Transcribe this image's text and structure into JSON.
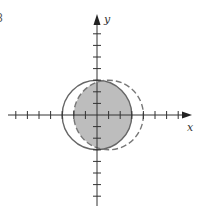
{
  "figure": {
    "number_label": "8",
    "x_axis_label": "x",
    "y_axis_label": "y"
  },
  "colors": {
    "axis": "#333333",
    "circle_stroke": "#666666",
    "shade_fill": "#bdbdbd",
    "background": "#ffffff"
  },
  "geometry": {
    "origin_px": [
      97,
      115
    ],
    "unit_px": 11.6,
    "x_ticks": [
      -7,
      -6,
      -5,
      -4,
      -3,
      -2,
      -1,
      1,
      2,
      3,
      4,
      5,
      6,
      7
    ],
    "y_ticks": [
      -7,
      -6,
      -5,
      -4,
      -3,
      -2,
      -1,
      1,
      2,
      3,
      4,
      5,
      6,
      7
    ],
    "solid_circle": {
      "center": [
        0,
        0
      ],
      "radius": 3,
      "style": "solid"
    },
    "dashed_circle": {
      "center": [
        1,
        0
      ],
      "radius": 3,
      "style": "dashed"
    },
    "shaded_region": "intersection of solid and dashed circles"
  }
}
